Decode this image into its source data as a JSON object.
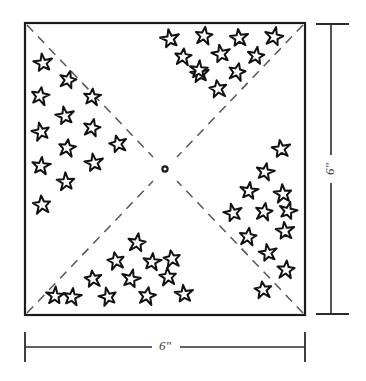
{
  "diagram": {
    "type": "quilt-block-pattern",
    "colors": {
      "outline": "#1a1a1a",
      "dashed_fold": "#555555",
      "star_outline": "#111111",
      "star_fill": "#ffffff",
      "background": "#ffffff",
      "dimension_line": "#2b2b2b",
      "dimension_text": "#3a3a3a"
    },
    "square": {
      "label": "fabric-square",
      "x": 25,
      "y": 23,
      "width": 280,
      "height": 292,
      "stroke_width": 2.2
    },
    "center_marker": {
      "label": "center-pivot-point",
      "cx": 165,
      "cy": 169,
      "r": 2.6
    },
    "fold_lines": [
      {
        "name": "fold-line-top-left",
        "x1": 27,
        "y1": 25,
        "x2": 153,
        "y2": 157
      },
      {
        "name": "fold-line-top-right",
        "x1": 303,
        "y1": 25,
        "x2": 177,
        "y2": 157
      },
      {
        "name": "fold-line-bottom-left",
        "x1": 27,
        "y1": 313,
        "x2": 153,
        "y2": 181
      },
      {
        "name": "fold-line-bottom-right",
        "x1": 303,
        "y1": 313,
        "x2": 177,
        "y2": 181
      }
    ],
    "dash_pattern": "9 7",
    "star_count": 52,
    "star_radius": 9.2,
    "stars": [
      {
        "region": "left",
        "x": 43,
        "y": 63,
        "r": 9.4,
        "rot": -8
      },
      {
        "region": "left",
        "x": 40,
        "y": 96,
        "r": 9.6,
        "rot": 10
      },
      {
        "region": "left",
        "x": 41,
        "y": 132,
        "r": 9.2,
        "rot": -12
      },
      {
        "region": "left",
        "x": 41,
        "y": 166,
        "r": 9.4,
        "rot": 6
      },
      {
        "region": "left",
        "x": 42,
        "y": 205,
        "r": 9.5,
        "rot": -6
      },
      {
        "region": "left",
        "x": 68,
        "y": 80,
        "r": 9.0,
        "rot": 14
      },
      {
        "region": "left",
        "x": 65,
        "y": 116,
        "r": 9.4,
        "rot": -10
      },
      {
        "region": "left",
        "x": 67,
        "y": 148,
        "r": 9.3,
        "rot": 8
      },
      {
        "region": "left",
        "x": 66,
        "y": 182,
        "r": 9.2,
        "rot": -4
      },
      {
        "region": "left",
        "x": 92,
        "y": 128,
        "r": 9.1,
        "rot": 12
      },
      {
        "region": "left",
        "x": 94,
        "y": 163,
        "r": 9.4,
        "rot": -9
      },
      {
        "region": "left",
        "x": 92,
        "y": 97,
        "r": 9.0,
        "rot": 5
      },
      {
        "region": "left",
        "x": 118,
        "y": 144,
        "r": 9.2,
        "rot": -14
      },
      {
        "region": "top",
        "x": 170,
        "y": 39,
        "r": 9.5,
        "rot": -10
      },
      {
        "region": "top",
        "x": 204,
        "y": 36,
        "r": 9.3,
        "rot": 8
      },
      {
        "region": "top",
        "x": 239,
        "y": 38,
        "r": 9.4,
        "rot": -6
      },
      {
        "region": "top",
        "x": 274,
        "y": 37,
        "r": 9.5,
        "rot": 12
      },
      {
        "region": "top",
        "x": 183,
        "y": 57,
        "r": 9.1,
        "rot": 6
      },
      {
        "region": "top",
        "x": 221,
        "y": 54,
        "r": 9.4,
        "rot": -11
      },
      {
        "region": "top",
        "x": 256,
        "y": 56,
        "r": 9.0,
        "rot": 9
      },
      {
        "region": "top",
        "x": 200,
        "y": 74,
        "r": 9.3,
        "rot": -7
      },
      {
        "region": "top",
        "x": 237,
        "y": 72,
        "r": 9.2,
        "rot": 13
      },
      {
        "region": "top",
        "x": 199,
        "y": 70,
        "r": 9.1,
        "rot": 4
      },
      {
        "region": "top",
        "x": 218,
        "y": 89,
        "r": 9.4,
        "rot": -9
      },
      {
        "region": "right",
        "x": 281,
        "y": 149,
        "r": 9.5,
        "rot": -8
      },
      {
        "region": "right",
        "x": 265,
        "y": 172,
        "r": 9.2,
        "rot": 11
      },
      {
        "region": "right",
        "x": 283,
        "y": 194,
        "r": 9.4,
        "rot": -5
      },
      {
        "region": "right",
        "x": 249,
        "y": 191,
        "r": 9.1,
        "rot": 7
      },
      {
        "region": "right",
        "x": 233,
        "y": 213,
        "r": 9.3,
        "rot": -13
      },
      {
        "region": "right",
        "x": 264,
        "y": 212,
        "r": 9.2,
        "rot": 10
      },
      {
        "region": "right",
        "x": 285,
        "y": 231,
        "r": 9.4,
        "rot": -6
      },
      {
        "region": "right",
        "x": 248,
        "y": 237,
        "r": 9.3,
        "rot": 8
      },
      {
        "region": "right",
        "x": 268,
        "y": 253,
        "r": 9.1,
        "rot": -10
      },
      {
        "region": "right",
        "x": 286,
        "y": 270,
        "r": 9.4,
        "rot": 5
      },
      {
        "region": "right",
        "x": 288,
        "y": 211,
        "r": 9.0,
        "rot": 14
      },
      {
        "region": "right",
        "x": 263,
        "y": 290,
        "r": 9.2,
        "rot": -7
      },
      {
        "region": "bottom",
        "x": 137,
        "y": 243,
        "r": 9.4,
        "rot": 9
      },
      {
        "region": "bottom",
        "x": 116,
        "y": 261,
        "r": 9.2,
        "rot": -11
      },
      {
        "region": "bottom",
        "x": 152,
        "y": 262,
        "r": 9.3,
        "rot": 6
      },
      {
        "region": "bottom",
        "x": 93,
        "y": 279,
        "r": 9.1,
        "rot": -8
      },
      {
        "region": "bottom",
        "x": 131,
        "y": 279,
        "r": 9.4,
        "rot": 12
      },
      {
        "region": "bottom",
        "x": 168,
        "y": 277,
        "r": 9.2,
        "rot": -5
      },
      {
        "region": "bottom",
        "x": 72,
        "y": 297,
        "r": 9.3,
        "rot": 7
      },
      {
        "region": "bottom",
        "x": 108,
        "y": 297,
        "r": 9.1,
        "rot": -13
      },
      {
        "region": "bottom",
        "x": 147,
        "y": 296,
        "r": 9.4,
        "rot": 10
      },
      {
        "region": "bottom",
        "x": 184,
        "y": 294,
        "r": 9.2,
        "rot": -6
      },
      {
        "region": "bottom",
        "x": 55,
        "y": 296,
        "r": 9.0,
        "rot": 4
      },
      {
        "region": "bottom",
        "x": 172,
        "y": 259,
        "r": 9.1,
        "rot": -9
      }
    ],
    "dimensions": [
      {
        "name": "height-dimension",
        "orientation": "vertical",
        "label": "6\"",
        "line": {
          "x1": 331,
          "y1": 24,
          "x2": 331,
          "y2": 314
        },
        "tick_start": {
          "x1": 316,
          "y1": 24,
          "x2": 349,
          "y2": 24
        },
        "tick_end": {
          "x1": 316,
          "y1": 314,
          "x2": 349,
          "y2": 314
        },
        "label_x": 331,
        "label_y": 169,
        "gap_top": 155,
        "gap_bottom": 183
      },
      {
        "name": "width-dimension",
        "orientation": "horizontal",
        "label": "6\"",
        "line": {
          "x1": 25,
          "y1": 347,
          "x2": 305,
          "y2": 347
        },
        "tick_start": {
          "x1": 25,
          "y1": 332,
          "x2": 25,
          "y2": 362
        },
        "tick_end": {
          "x1": 305,
          "y1": 332,
          "x2": 305,
          "y2": 362
        },
        "label_x": 165,
        "label_y": 347,
        "gap_left": 152,
        "gap_right": 180
      }
    ]
  }
}
